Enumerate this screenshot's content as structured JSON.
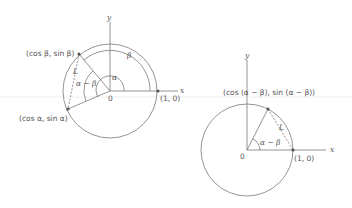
{
  "left_figure": {
    "axis_x": "x",
    "axis_y": "y",
    "origin": "0",
    "point_unit": "(1, 0)",
    "point_beta": "(cos β, sin β)",
    "point_alpha": "(cos α, sin α)",
    "angle_alpha": "α",
    "angle_beta": "β",
    "angle_diff": "α − β",
    "chord": "L"
  },
  "right_figure": {
    "axis_x": "x",
    "axis_y": "y",
    "origin": "0",
    "point_unit": "(1, 0)",
    "point_diff": "(cos (α − β), sin (α − β))",
    "angle_diff": "α − β",
    "chord": "L"
  },
  "colors": {
    "line": "#7a7a7a",
    "text": "#555555",
    "point": "#555555"
  }
}
